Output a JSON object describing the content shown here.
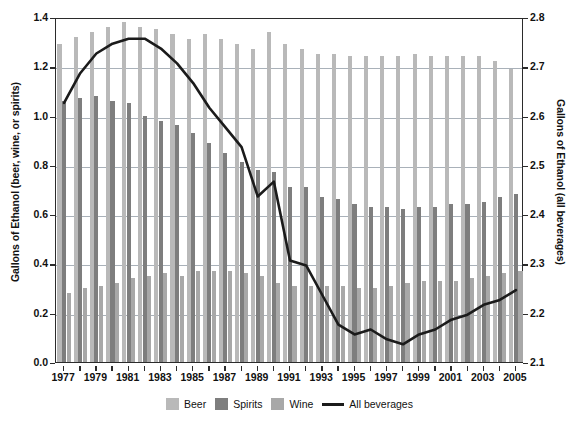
{
  "chart_data": {
    "type": "bar",
    "title": "",
    "subtitle": "",
    "xlabel": "",
    "ylabel": "Gallons of Ethanol (beer, wine, or spirits)",
    "y2label": "Gallons of Ethanol (all beverages)",
    "grid": true,
    "legend_position": "bottom",
    "ylim": [
      0.0,
      1.4
    ],
    "y2lim": [
      2.1,
      2.8
    ],
    "yticks": [
      "0.0",
      "0.2",
      "0.4",
      "0.6",
      "0.8",
      "1.0",
      "1.2",
      "1.4"
    ],
    "ytick_values": [
      0.0,
      0.2,
      0.4,
      0.6,
      0.8,
      1.0,
      1.2,
      1.4
    ],
    "y2ticks": [
      "2.1",
      "2.2",
      "2.3",
      "2.4",
      "2.5",
      "2.6",
      "2.7",
      "2.8"
    ],
    "y2tick_values": [
      2.1,
      2.2,
      2.3,
      2.4,
      2.5,
      2.6,
      2.7,
      2.8
    ],
    "categories": [
      1977,
      1978,
      1979,
      1980,
      1981,
      1982,
      1983,
      1984,
      1985,
      1986,
      1987,
      1988,
      1989,
      1990,
      1991,
      1992,
      1993,
      1994,
      1995,
      1996,
      1997,
      1998,
      1999,
      2000,
      2001,
      2002,
      2003,
      2004,
      2005
    ],
    "xtick_labels": [
      "1977",
      "1979",
      "1981",
      "1983",
      "1985",
      "1987",
      "1989",
      "1991",
      "1993",
      "1995",
      "1997",
      "1999",
      "2001",
      "2003",
      "2005"
    ],
    "series": [
      {
        "name": "Beer",
        "color": "#b9b9b9",
        "axis": "left",
        "values": [
          1.29,
          1.32,
          1.34,
          1.36,
          1.38,
          1.36,
          1.35,
          1.33,
          1.31,
          1.33,
          1.31,
          1.29,
          1.27,
          1.34,
          1.29,
          1.27,
          1.25,
          1.25,
          1.24,
          1.24,
          1.24,
          1.24,
          1.25,
          1.24,
          1.24,
          1.24,
          1.24,
          1.22,
          1.19
        ]
      },
      {
        "name": "Spirits",
        "color": "#7e7e7e",
        "axis": "left",
        "values": [
          1.06,
          1.07,
          1.08,
          1.06,
          1.05,
          1.0,
          0.98,
          0.96,
          0.93,
          0.89,
          0.85,
          0.81,
          0.78,
          0.77,
          0.71,
          0.71,
          0.67,
          0.66,
          0.64,
          0.63,
          0.63,
          0.62,
          0.63,
          0.63,
          0.64,
          0.64,
          0.65,
          0.67,
          0.68
        ]
      },
      {
        "name": "Wine",
        "color": "#a8a8a8",
        "axis": "left",
        "values": [
          0.28,
          0.3,
          0.31,
          0.32,
          0.34,
          0.35,
          0.36,
          0.35,
          0.37,
          0.37,
          0.37,
          0.36,
          0.35,
          0.32,
          0.31,
          0.31,
          0.31,
          0.31,
          0.3,
          0.3,
          0.31,
          0.32,
          0.33,
          0.33,
          0.33,
          0.34,
          0.35,
          0.36,
          0.37
        ]
      },
      {
        "name": "All beverages",
        "color": "#1b1b1b",
        "axis": "right",
        "type": "line",
        "values": [
          2.63,
          2.69,
          2.73,
          2.75,
          2.76,
          2.76,
          2.74,
          2.71,
          2.67,
          2.62,
          2.58,
          2.54,
          2.44,
          2.47,
          2.31,
          2.3,
          2.24,
          2.18,
          2.16,
          2.17,
          2.15,
          2.14,
          2.16,
          2.17,
          2.19,
          2.2,
          2.22,
          2.23,
          2.25
        ]
      }
    ]
  },
  "legend": {
    "items": [
      {
        "label": "Beer",
        "kind": "swatch",
        "color": "#b9b9b9"
      },
      {
        "label": "Spirits",
        "kind": "swatch",
        "color": "#7e7e7e"
      },
      {
        "label": "Wine",
        "kind": "swatch",
        "color": "#a8a8a8"
      },
      {
        "label": "All beverages",
        "kind": "line",
        "color": "#1b1b1b"
      }
    ]
  }
}
